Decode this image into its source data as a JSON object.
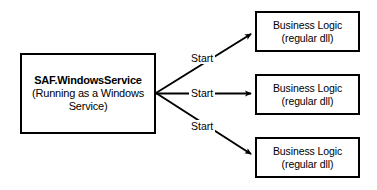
{
  "diagram": {
    "background_color": "#ffffff",
    "stroke_color": "#000000",
    "service_node": {
      "title": "SAF.WindowsService",
      "subtitle_line_1": "(Running as a Windows",
      "subtitle_line_2": "Service)"
    },
    "logic_nodes": [
      {
        "title": "Business Logic",
        "subtitle": "(regular dll)"
      },
      {
        "title": "Business Logic",
        "subtitle": "(regular dll)"
      },
      {
        "title": "Business Logic",
        "subtitle": "(regular dll)"
      }
    ],
    "edges": [
      {
        "label": "Start"
      },
      {
        "label": "Start"
      },
      {
        "label": "Start"
      }
    ]
  }
}
